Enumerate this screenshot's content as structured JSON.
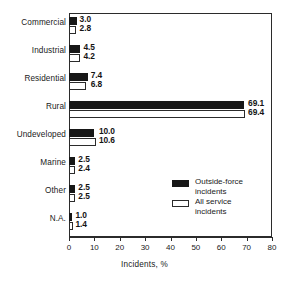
{
  "chart_data": {
    "type": "bar",
    "orientation": "horizontal",
    "title": "",
    "xlabel": "Incidents, %",
    "ylabel": "",
    "xlim": [
      0,
      80
    ],
    "xticks": [
      0,
      10,
      20,
      30,
      40,
      50,
      60,
      70,
      80
    ],
    "xtick_labels": [
      "0",
      "10",
      "20",
      "30",
      "40",
      "50",
      "60",
      "70",
      "80"
    ],
    "grid": false,
    "legend_position": "inside-lower-right",
    "categories": [
      "Commercial",
      "Industrial",
      "Residential",
      "Rural",
      "Undeveloped",
      "Marine",
      "Other",
      "N.A."
    ],
    "series": [
      {
        "name": "Outside-force incidents",
        "style": "filled-black",
        "color": "#171717",
        "values": [
          3.0,
          4.5,
          7.4,
          69.1,
          10.0,
          2.5,
          2.5,
          1.0
        ],
        "labels": [
          "3.0",
          "4.5",
          "7.4",
          "69.1",
          "10.0",
          "2.5",
          "2.5",
          "1.0"
        ]
      },
      {
        "name": "All service incidents",
        "style": "open-white",
        "color": "#ffffff",
        "edge_color": "#2b2b2b",
        "values": [
          2.8,
          4.2,
          6.8,
          69.4,
          10.6,
          2.4,
          2.5,
          1.4
        ],
        "labels": [
          "2.8",
          "4.2",
          "6.8",
          "69.4",
          "10.6",
          "2.4",
          "2.5",
          "1.4"
        ]
      }
    ]
  },
  "legend": {
    "items": [
      {
        "label": "Outside-force\nincidents",
        "swatch": "filled-black"
      },
      {
        "label": "All  service\nincidents",
        "swatch": "open-white"
      }
    ]
  }
}
